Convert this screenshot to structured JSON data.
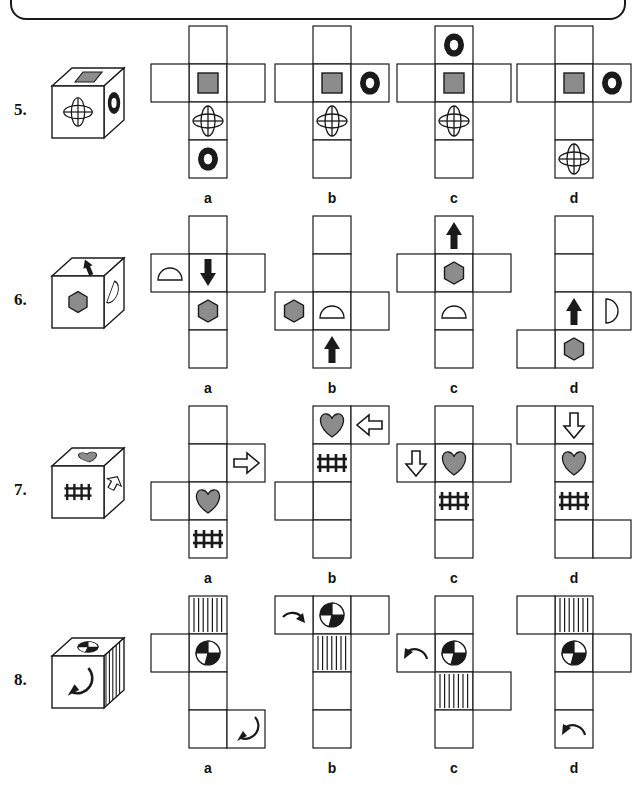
{
  "page": {
    "title_box": "",
    "background": "#ffffff",
    "ink": "#1a1a1a",
    "fill_gray": "#8c8c8c"
  },
  "rows": [
    {
      "number": "5.",
      "cube": {
        "name": "cube-5",
        "top_face": "gray-square-icon",
        "front_face": "flower-ellipse-icon",
        "right_face": "ring-icon"
      },
      "options": [
        {
          "label": "a",
          "name": "net-5a",
          "shape": "cross-column4-arms-row2",
          "column": [
            "",
            "gray-square-icon",
            "flower-ellipse-icon",
            "ring-icon"
          ],
          "left_arm": {
            "row": 2,
            "icon": ""
          },
          "right_arm": {
            "row": 2,
            "icon": ""
          }
        },
        {
          "label": "b",
          "name": "net-5b",
          "shape": "cross-column4-arms-row2",
          "column": [
            "",
            "gray-square-icon",
            "flower-ellipse-icon",
            ""
          ],
          "left_arm": {
            "row": 2,
            "icon": ""
          },
          "right_arm": {
            "row": 2,
            "icon": "ring-icon"
          }
        },
        {
          "label": "c",
          "name": "net-5c",
          "shape": "cross-column4-arms-row2",
          "column": [
            "ring-icon",
            "gray-square-icon",
            "flower-ellipse-icon",
            ""
          ],
          "left_arm": {
            "row": 2,
            "icon": ""
          },
          "right_arm": {
            "row": 2,
            "icon": ""
          }
        },
        {
          "label": "d",
          "name": "net-5d",
          "shape": "cross-column4-arms-row2",
          "column": [
            "",
            "gray-square-icon",
            "",
            "flower-ellipse-icon"
          ],
          "left_arm": {
            "row": 2,
            "icon": ""
          },
          "right_arm": {
            "row": 2,
            "icon": "ring-icon"
          }
        }
      ]
    },
    {
      "number": "6.",
      "cube": {
        "name": "cube-6",
        "top_face": "black-arrow-icon",
        "front_face": "gray-hexagon-icon",
        "right_face": "half-circle-icon"
      },
      "options": [
        {
          "label": "a",
          "name": "net-6a",
          "shape": "cross-column4-arms-row2",
          "column": [
            "",
            "arrow-down-icon",
            "gray-hexagon-icon",
            ""
          ],
          "left_arm": {
            "row": 2,
            "icon": "half-circle-up-icon"
          },
          "right_arm": {
            "row": 2,
            "icon": ""
          }
        },
        {
          "label": "b",
          "name": "net-6b",
          "shape": "cross-column4-arms-row3",
          "column": [
            "",
            "",
            "half-circle-up-icon",
            "arrow-up-icon"
          ],
          "left_arm": {
            "row": 3,
            "icon": "gray-hexagon-icon"
          },
          "right_arm": {
            "row": 3,
            "icon": ""
          }
        },
        {
          "label": "c",
          "name": "net-6c",
          "shape": "cross-column4-arms-row2",
          "column": [
            "arrow-up-icon",
            "gray-hexagon-icon",
            "half-circle-up-icon",
            ""
          ],
          "left_arm": {
            "row": 2,
            "icon": ""
          },
          "right_arm": {
            "row": 2,
            "icon": ""
          }
        },
        {
          "label": "d",
          "name": "net-6d",
          "shape": "zigzag-right3-left4",
          "column": [
            "",
            "",
            "arrow-up-icon",
            "gray-hexagon-icon"
          ],
          "left_arm": {
            "row": 4,
            "icon": ""
          },
          "right_arm": {
            "row": 3,
            "icon": "half-circle-right-icon"
          }
        }
      ]
    },
    {
      "number": "7.",
      "cube": {
        "name": "cube-7",
        "top_face": "gray-heart-icon",
        "front_face": "tally-marks-icon",
        "right_face": "outline-arrow-icon"
      },
      "options": [
        {
          "label": "a",
          "name": "net-7a",
          "shape": "zigzag-right2-left3",
          "column": [
            "",
            "",
            "gray-heart-icon",
            "tally-marks-icon"
          ],
          "left_arm": {
            "row": 3,
            "icon": ""
          },
          "right_arm": {
            "row": 2,
            "icon": "arrow-right-outline-icon"
          }
        },
        {
          "label": "b",
          "name": "net-7b",
          "shape": "zigzag-right1-left3",
          "column": [
            "gray-heart-icon",
            "tally-marks-icon",
            "",
            ""
          ],
          "left_arm": {
            "row": 3,
            "icon": ""
          },
          "right_arm": {
            "row": 1,
            "icon": "arrow-left-outline-icon"
          }
        },
        {
          "label": "c",
          "name": "net-7c",
          "shape": "cross-column4-arms-row2",
          "column": [
            "",
            "gray-heart-icon",
            "tally-marks-icon",
            ""
          ],
          "left_arm": {
            "row": 2,
            "icon": "arrow-down-outline-icon"
          },
          "right_arm": {
            "row": 2,
            "icon": ""
          }
        },
        {
          "label": "d",
          "name": "net-7d",
          "shape": "zigzag-left1-right4",
          "column": [
            "arrow-down-outline-icon",
            "gray-heart-icon",
            "tally-marks-icon",
            ""
          ],
          "left_arm": {
            "row": 1,
            "icon": ""
          },
          "right_arm": {
            "row": 4,
            "icon": ""
          }
        }
      ]
    },
    {
      "number": "8.",
      "cube": {
        "name": "cube-8",
        "top_face": "pie-circle-icon",
        "front_face": "curved-arrow-icon",
        "right_face": "striped-icon"
      },
      "options": [
        {
          "label": "a",
          "name": "net-8a",
          "shape": "zigzag-left2-right4",
          "column": [
            "striped-icon",
            "pie-circle-icon",
            "",
            ""
          ],
          "left_arm": {
            "row": 2,
            "icon": ""
          },
          "right_arm": {
            "row": 4,
            "icon": "curved-arrow-down-icon"
          }
        },
        {
          "label": "b",
          "name": "net-8b",
          "shape": "zigzag-left1-right1",
          "column": [
            "pie-circle-icon",
            "striped-icon",
            "",
            ""
          ],
          "left_arm": {
            "row": 1,
            "icon": "curved-arrow-right-icon"
          },
          "right_arm": {
            "row": 1,
            "icon": ""
          }
        },
        {
          "label": "c",
          "name": "net-8c",
          "shape": "zigzag-left2-right3",
          "column": [
            "",
            "pie-circle-icon",
            "striped-icon",
            ""
          ],
          "left_arm": {
            "row": 2,
            "icon": "curved-arrow-left-icon"
          },
          "right_arm": {
            "row": 3,
            "icon": ""
          }
        },
        {
          "label": "d",
          "name": "net-8d",
          "shape": "zigzag-left1-right2",
          "column": [
            "striped-icon",
            "pie-circle-icon",
            "",
            "curved-arrow-left-icon"
          ],
          "left_arm": {
            "row": 1,
            "icon": ""
          },
          "right_arm": {
            "row": 2,
            "icon": ""
          }
        }
      ]
    }
  ]
}
